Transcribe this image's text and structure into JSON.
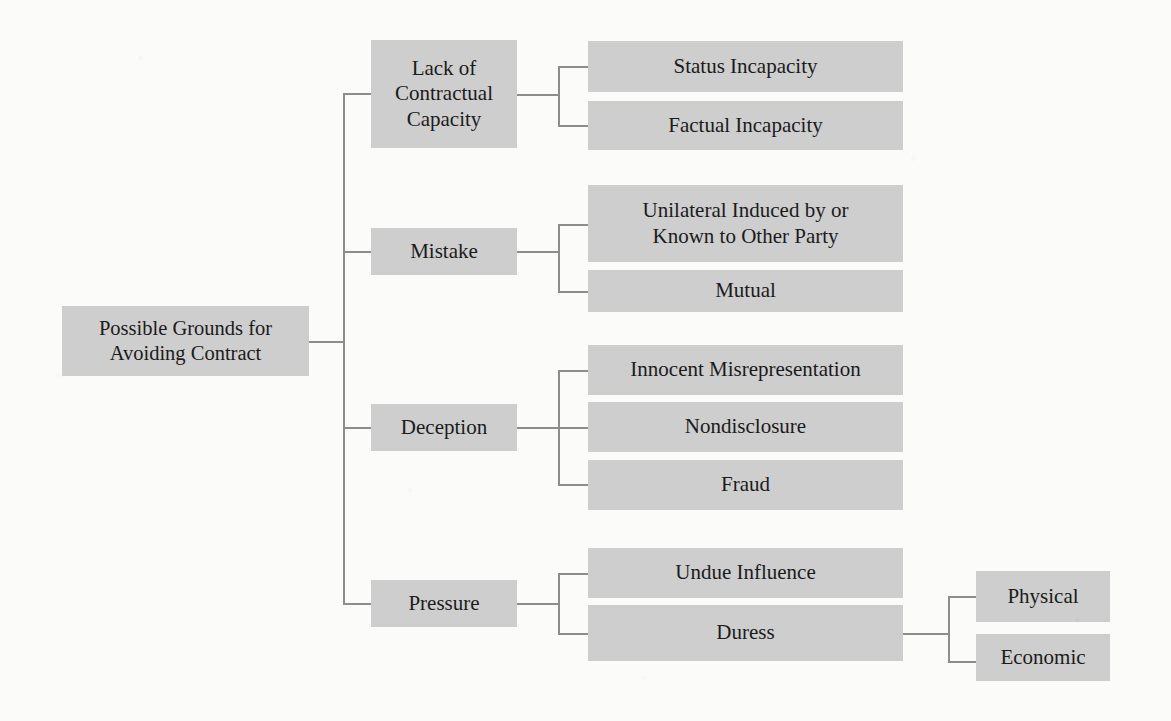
{
  "diagram": {
    "title": "Possible Grounds for Avoiding Contract",
    "type": "hierarchy-tree",
    "box_fill_color": "#cecece",
    "connector_color": "#8d8d8d",
    "background_color": "#fbfbf9",
    "text_color": "#1b1b1b",
    "root": {
      "label_line1": "Possible Grounds for",
      "label_line2": "Avoiding Contract"
    },
    "branches": [
      {
        "label_line1": "Lack of",
        "label_line2": "Contractual",
        "label_line3": "Capacity",
        "children": [
          {
            "label": "Status Incapacity"
          },
          {
            "label": "Factual Incapacity"
          }
        ]
      },
      {
        "label_line1": "Mistake",
        "children": [
          {
            "label_line1": "Unilateral Induced by or",
            "label_line2": "Known to Other Party"
          },
          {
            "label": "Mutual"
          }
        ]
      },
      {
        "label_line1": "Deception",
        "children": [
          {
            "label": "Innocent Misrepresentation"
          },
          {
            "label": "Nondisclosure"
          },
          {
            "label": "Fraud"
          }
        ]
      },
      {
        "label_line1": "Pressure",
        "children": [
          {
            "label": "Undue Influence"
          },
          {
            "label": "Duress",
            "children": [
              {
                "label": "Physical"
              },
              {
                "label": "Economic"
              }
            ]
          }
        ]
      }
    ]
  }
}
